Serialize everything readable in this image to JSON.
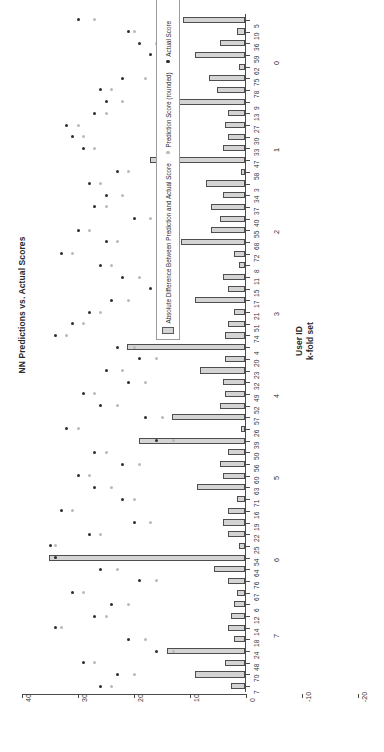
{
  "chart_data": {
    "type": "bar",
    "title": "NN Predictions vs. Actual Scores",
    "xlabel_line1": "User ID",
    "xlabel_line2": "k-fold set",
    "ylabel": "",
    "orientation": "horizontal",
    "ylim": [
      -20,
      40
    ],
    "value_ticks": [
      "40",
      "30",
      "20",
      "10",
      "0",
      "-10",
      "-20"
    ],
    "value_tick_values": [
      40,
      30,
      20,
      10,
      0,
      -10,
      -20
    ],
    "grid": false,
    "legend_position": "bottom-right",
    "legend": [
      {
        "label": "Absolute Difference Between Prediction and Actual Score",
        "marker": "bar",
        "color": "#d4d4d4"
      },
      {
        "label": "Prediction Score (rounded)",
        "marker": "dot",
        "color": "#b9b9b9"
      },
      {
        "label": "Actual Score",
        "marker": "dot",
        "color": "#2e2e2e"
      }
    ],
    "fold_labels": [
      "0",
      "1",
      "2",
      "3",
      "4",
      "5",
      "6",
      "7"
    ],
    "categories": [
      "5",
      "10",
      "36",
      "59",
      "62",
      "75",
      "78",
      "9",
      "13",
      "27",
      "30",
      "33",
      "47",
      "58",
      "3",
      "34",
      "37",
      "40",
      "55",
      "68",
      "72",
      "8",
      "11",
      "15",
      "17",
      "21",
      "51",
      "74",
      "4",
      "20",
      "23",
      "32",
      "49",
      "52",
      "57",
      "26",
      "39",
      "50",
      "56",
      "60",
      "63",
      "71",
      "16",
      "19",
      "22",
      "25",
      "54",
      "64",
      "76",
      "67",
      "6",
      "12",
      "14",
      "18",
      "24",
      "48",
      "70",
      "7"
    ],
    "series": [
      {
        "name": "Absolute Difference Between Prediction and Actual Score",
        "values": [
          11.0,
          1.5,
          4.5,
          9.0,
          1.0,
          6.5,
          5.0,
          12.5,
          3.0,
          3.5,
          3.0,
          4.0,
          17.0,
          0.8,
          7.0,
          4.0,
          6.0,
          4.5,
          6.0,
          11.5,
          2.0,
          1.0,
          4.0,
          3.0,
          9.0,
          2.0,
          3.0,
          3.5,
          21.0,
          3.5,
          8.0,
          4.0,
          3.5,
          4.5,
          13.0,
          0.8,
          19.0,
          3.0,
          4.5,
          4.0,
          8.5,
          1.5,
          3.0,
          4.0,
          3.0,
          1.0,
          35.0,
          5.5,
          3.0,
          1.5,
          2.0,
          2.5,
          3.0,
          2.0,
          14.0,
          3.5,
          9.0,
          2.5
        ]
      },
      {
        "name": "Prediction Score (rounded)",
        "values": [
          27.0,
          20.0,
          16.0,
          14.0,
          13.0,
          18.0,
          24.0,
          22.0,
          25.0,
          30.0,
          29.0,
          27.0,
          12.0,
          21.0,
          26.0,
          22.0,
          25.0,
          17.0,
          28.0,
          23.0,
          31.0,
          24.0,
          19.0,
          14.0,
          21.0,
          26.0,
          29.0,
          32.0,
          20.0,
          16.0,
          22.0,
          18.0,
          27.0,
          23.0,
          15.0,
          30.0,
          13.0,
          25.0,
          19.0,
          28.0,
          24.0,
          20.0,
          31.0,
          17.0,
          26.0,
          34.0,
          34.0,
          23.0,
          16.0,
          29.0,
          21.0,
          25.0,
          33.0,
          18.0,
          13.0,
          27.0,
          20.0,
          24.0
        ]
      },
      {
        "name": "Actual Score",
        "values": [
          30.0,
          21.0,
          19.0,
          17.0,
          15.0,
          22.0,
          26.0,
          25.0,
          27.0,
          32.0,
          31.0,
          29.0,
          14.0,
          23.0,
          28.0,
          25.0,
          27.0,
          20.0,
          30.0,
          25.0,
          33.0,
          26.0,
          22.0,
          17.0,
          24.0,
          28.0,
          31.0,
          34.0,
          23.0,
          19.0,
          25.0,
          21.0,
          29.0,
          26.0,
          18.0,
          32.0,
          16.0,
          27.0,
          22.0,
          30.0,
          27.0,
          22.0,
          33.0,
          20.0,
          28.0,
          35.0,
          34.0,
          26.0,
          19.0,
          31.0,
          24.0,
          27.0,
          34.0,
          21.0,
          16.0,
          29.0,
          23.0,
          26.0
        ]
      }
    ],
    "bar_values": [
      11.0,
      1.5,
      4.5,
      9.0,
      1.0,
      6.5,
      5.0,
      12.5,
      3.0,
      3.5,
      3.0,
      4.0,
      17.0,
      0.8,
      7.0,
      4.0,
      6.0,
      4.5,
      6.0,
      11.5,
      2.0,
      1.0,
      4.0,
      3.0,
      9.0,
      2.0,
      3.0,
      3.5,
      21.0,
      3.5,
      8.0,
      4.0,
      3.5,
      4.5,
      13.0,
      0.8,
      19.0,
      3.0,
      4.5,
      4.0,
      8.5,
      1.5,
      3.0,
      4.0,
      3.0,
      1.0,
      35.0,
      5.5,
      3.0,
      1.5,
      2.0,
      2.5,
      3.0,
      2.0,
      14.0,
      3.5,
      9.0,
      2.5
    ],
    "tick_label_groups": [
      {
        "fold": "0",
        "ids": [
          "5",
          "10",
          "36",
          "59",
          "62",
          "75",
          "78",
          "9"
        ]
      },
      {
        "fold": "1",
        "ids": [
          "13",
          "27",
          "30",
          "33",
          "47",
          "58",
          "3"
        ]
      },
      {
        "fold": "2",
        "ids": [
          "34",
          "37",
          "40",
          "55",
          "68",
          "72",
          "8"
        ]
      },
      {
        "fold": "3",
        "ids": [
          "11",
          "15",
          "17",
          "21",
          "51",
          "74",
          "4"
        ]
      },
      {
        "fold": "4",
        "ids": [
          "20",
          "23",
          "32",
          "49",
          "52",
          "57",
          "26"
        ]
      },
      {
        "fold": "5",
        "ids": [
          "39",
          "50",
          "56",
          "60",
          "63",
          "71",
          "16"
        ]
      },
      {
        "fold": "6",
        "ids": [
          "19",
          "22",
          "25",
          "54",
          "64",
          "76",
          "67"
        ]
      },
      {
        "fold": "7",
        "ids": [
          "12",
          "14",
          "18",
          "24",
          "48",
          "70"
        ]
      }
    ]
  }
}
